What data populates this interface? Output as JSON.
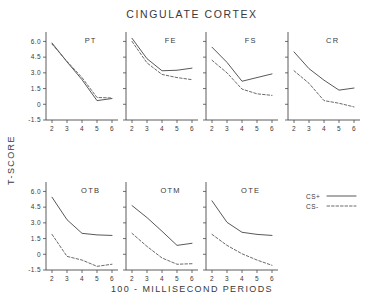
{
  "chart_data": {
    "type": "line",
    "title": "CINGULATE CORTEX",
    "xlabel": "100 - MILLISECOND PERIODS",
    "ylabel": "T-SCORE",
    "x": [
      2,
      3,
      4,
      5,
      6
    ],
    "xlim": [
      1.6,
      6.4
    ],
    "ylim": [
      -1.5,
      6.9
    ],
    "yticks": [
      -1.5,
      0,
      1.5,
      3.0,
      4.5,
      6.0
    ],
    "ytick_labels": [
      "-1.5",
      "0",
      "1.5",
      "3.0",
      "4.5",
      "6.0"
    ],
    "xticks": [
      2,
      3,
      4,
      5,
      6
    ],
    "xtick_labels": [
      "2",
      "3",
      "4",
      "5",
      "6"
    ],
    "grid": false,
    "legend": {
      "position": "right",
      "entries": [
        {
          "label": "CS+",
          "style": "solid"
        },
        {
          "label": "CS-",
          "style": "dashed"
        }
      ]
    },
    "panels": [
      {
        "label": "PT",
        "row": 0,
        "col": 0,
        "series": [
          {
            "name": "CS+",
            "style": "solid",
            "values": [
              5.85,
              4.05,
              2.35,
              0.35,
              0.55
            ]
          },
          {
            "name": "CS-",
            "style": "dashed",
            "values": [
              5.75,
              4.1,
              2.55,
              0.65,
              0.6
            ]
          }
        ]
      },
      {
        "label": "FE",
        "row": 0,
        "col": 1,
        "series": [
          {
            "name": "CS+",
            "style": "solid",
            "values": [
              6.3,
              4.35,
              3.2,
              3.25,
              3.45
            ]
          },
          {
            "name": "CS-",
            "style": "dashed",
            "values": [
              6.0,
              3.95,
              2.85,
              2.55,
              2.35
            ]
          }
        ]
      },
      {
        "label": "FS",
        "row": 0,
        "col": 2,
        "series": [
          {
            "name": "CS+",
            "style": "solid",
            "values": [
              5.45,
              4.0,
              2.2,
              2.55,
              2.9
            ]
          },
          {
            "name": "CS-",
            "style": "dashed",
            "values": [
              4.2,
              3.0,
              1.45,
              1.0,
              0.85
            ]
          }
        ]
      },
      {
        "label": "CR",
        "row": 0,
        "col": 3,
        "series": [
          {
            "name": "CS+",
            "style": "solid",
            "values": [
              5.0,
              3.4,
              2.3,
              1.35,
              1.55
            ]
          },
          {
            "name": "CS-",
            "style": "dashed",
            "values": [
              3.2,
              2.0,
              0.35,
              0.1,
              -0.25
            ]
          }
        ]
      },
      {
        "label": "OTB",
        "row": 1,
        "col": 0,
        "series": [
          {
            "name": "CS+",
            "style": "solid",
            "values": [
              5.45,
              3.3,
              2.0,
              1.85,
              1.8
            ]
          },
          {
            "name": "CS-",
            "style": "dashed",
            "values": [
              1.9,
              -0.2,
              -0.55,
              -1.15,
              -0.95
            ]
          }
        ]
      },
      {
        "label": "OTM",
        "row": 1,
        "col": 1,
        "series": [
          {
            "name": "CS+",
            "style": "solid",
            "values": [
              4.65,
              3.5,
              2.2,
              0.85,
              1.05
            ]
          },
          {
            "name": "CS-",
            "style": "dashed",
            "values": [
              2.0,
              0.75,
              -0.35,
              -0.95,
              -0.9
            ]
          }
        ]
      },
      {
        "label": "OTE",
        "row": 1,
        "col": 2,
        "series": [
          {
            "name": "CS+",
            "style": "solid",
            "values": [
              5.1,
              3.05,
              2.1,
              1.9,
              1.8
            ]
          },
          {
            "name": "CS-",
            "style": "dashed",
            "values": [
              1.9,
              0.85,
              0.05,
              -0.55,
              -1.05
            ]
          }
        ]
      }
    ]
  }
}
